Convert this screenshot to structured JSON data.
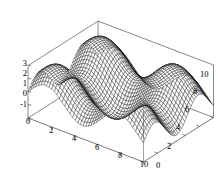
{
  "figure": {
    "kind": "surface-plot-3d",
    "background_color": "#ffffff",
    "mesh_color": "#000000",
    "frame_color": "#555555",
    "surface_fill": "#ffffff",
    "title": "",
    "mesh_divisions": 44
  },
  "chart_data": {
    "type": "surface",
    "title": "",
    "xlabel": "",
    "ylabel": "",
    "zlabel": "",
    "xlim": [
      0,
      10
    ],
    "ylim": [
      0,
      10
    ],
    "zlim": [
      -1,
      3
    ],
    "grid": false,
    "legend": "none",
    "projection": "3d-wireframe",
    "function": "sin(x) + sin(y) + 1",
    "x_ticks": [
      0,
      2,
      4,
      6,
      8,
      10
    ],
    "x_tick_labels": [
      "0",
      "2",
      "4",
      "6",
      "8",
      "10"
    ],
    "y_ticks": [
      0,
      2,
      4,
      6,
      8,
      10
    ],
    "y_tick_labels": [
      "0",
      "2",
      "4",
      "6",
      "8",
      "10"
    ],
    "z_ticks": [
      -1,
      0,
      1,
      2,
      3
    ],
    "z_tick_labels": [
      "-1",
      "0",
      "1",
      "2",
      "3"
    ],
    "samples": 45
  },
  "axes": {
    "z_axis": {
      "name": "z-axis",
      "labels": [
        "3",
        "2",
        "1",
        "0",
        "-1"
      ]
    },
    "x_axis": {
      "name": "x-axis",
      "labels": [
        "0",
        "2",
        "4",
        "6",
        "8",
        "10"
      ]
    },
    "y_axis": {
      "name": "y-axis",
      "labels": [
        "0",
        "2",
        "4",
        "6",
        "8",
        "10"
      ]
    }
  },
  "labels": {
    "z_3": "3",
    "z_2": "2",
    "z_1": "1",
    "z_0": "0",
    "z_m1": "-1",
    "x_0": "0",
    "x_2": "2",
    "x_4": "4",
    "x_6": "6",
    "x_8": "8",
    "x_10": "10",
    "y_0": "0",
    "y_2": "2",
    "y_4": "4",
    "y_6": "6",
    "y_8": "8",
    "y_10": "10"
  }
}
